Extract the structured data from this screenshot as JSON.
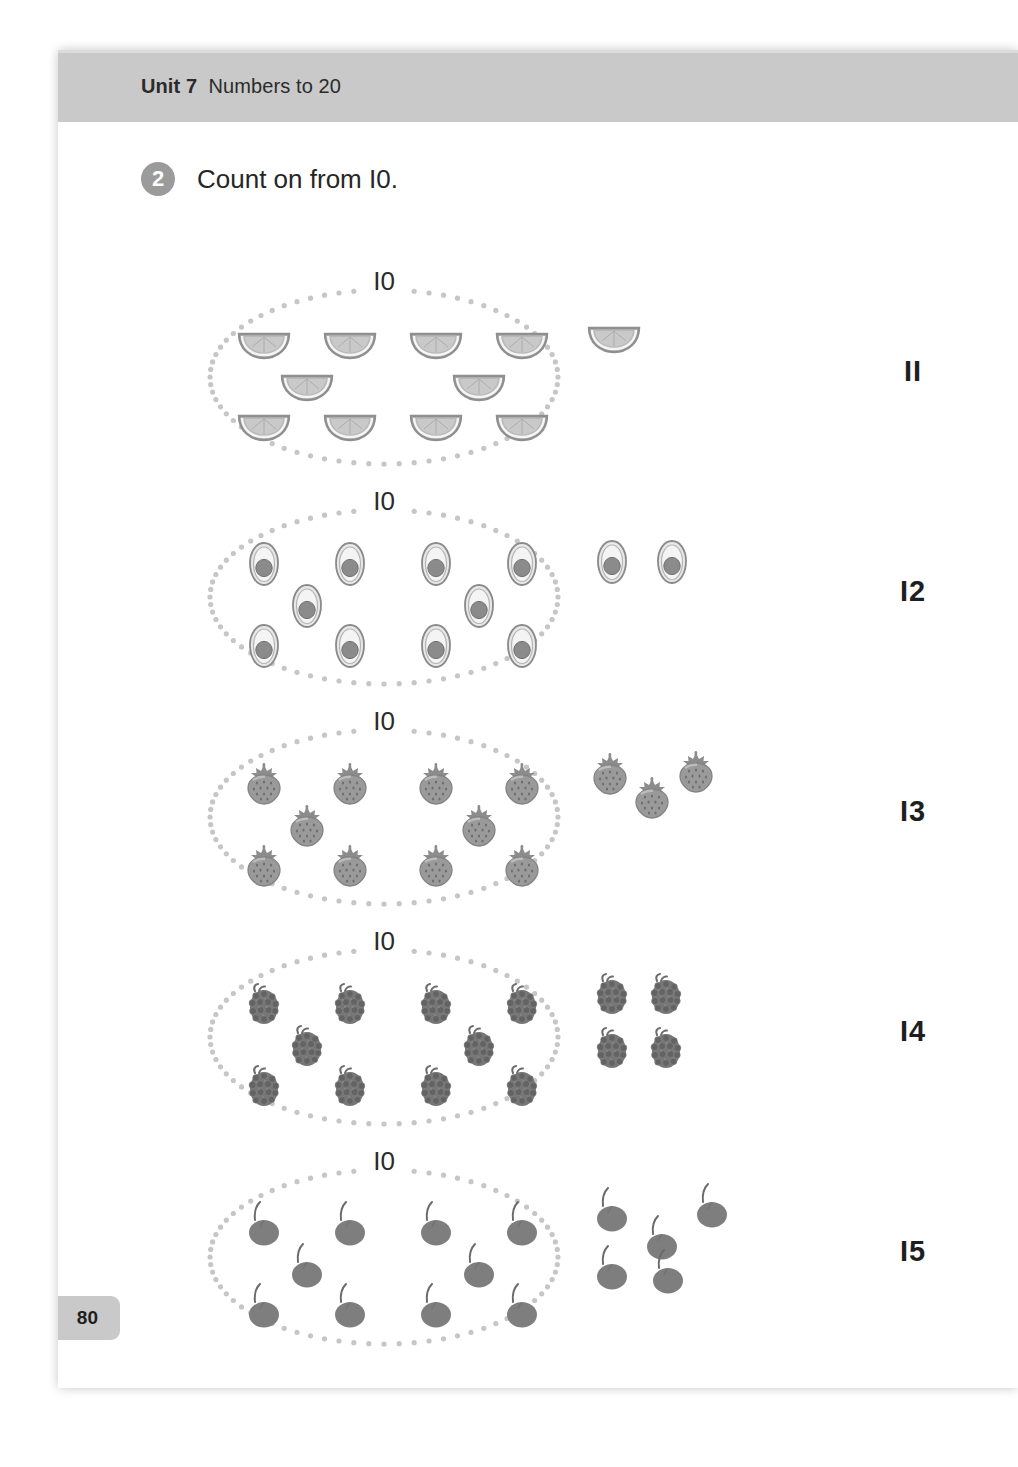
{
  "header": {
    "unit_label": "Unit 7",
    "unit_title": "Numbers to 20",
    "band_color": "#c9c9c9"
  },
  "task": {
    "number": "2",
    "prompt": "Count on from I0.",
    "badge_color": "#9b9b9b"
  },
  "page_number": "80",
  "colors": {
    "ink": "#2b2b2b",
    "dotted_ring": "#c6c6c6",
    "citrus_fill": "#b9b9b9",
    "citrus_rind": "#8f8f8f",
    "avocado_flesh": "#e8e8e8",
    "avocado_pit": "#8b8b8b",
    "strawberry": "#9a9a9a",
    "blackberry": "#767676",
    "cherry": "#7e7e7e"
  },
  "rows": [
    {
      "id": "row-oranges",
      "group_label": "I0",
      "group_count": 10,
      "loose_count": 1,
      "answer": "II",
      "fruit": "orange-wedge-icon",
      "fruit_name": "orange wedge"
    },
    {
      "id": "row-avocados",
      "group_label": "I0",
      "group_count": 10,
      "loose_count": 2,
      "answer": "I2",
      "fruit": "avocado-half-icon",
      "fruit_name": "avocado half"
    },
    {
      "id": "row-strawberries",
      "group_label": "I0",
      "group_count": 10,
      "loose_count": 3,
      "answer": "I3",
      "fruit": "strawberry-icon",
      "fruit_name": "strawberry"
    },
    {
      "id": "row-blackberries",
      "group_label": "I0",
      "group_count": 10,
      "loose_count": 4,
      "answer": "I4",
      "fruit": "blackberry-icon",
      "fruit_name": "blackberry"
    },
    {
      "id": "row-cherries",
      "group_label": "I0",
      "group_count": 10,
      "loose_count": 5,
      "answer": "I5",
      "fruit": "cherry-icon",
      "fruit_name": "cherry"
    }
  ],
  "layout": {
    "row_tops": [
      228,
      448,
      668,
      888,
      1108
    ],
    "group_positions": [
      [
        14,
        48
      ],
      [
        100,
        48
      ],
      [
        186,
        48
      ],
      [
        272,
        48
      ],
      [
        57,
        90
      ],
      [
        229,
        90
      ],
      [
        14,
        130
      ],
      [
        100,
        130
      ],
      [
        186,
        130
      ],
      [
        272,
        130
      ]
    ],
    "loose_positions": {
      "1": [
        [
          10,
          42
        ]
      ],
      "2": [
        [
          8,
          46
        ],
        [
          68,
          46
        ]
      ],
      "3": [
        [
          6,
          38
        ],
        [
          48,
          62
        ],
        [
          92,
          36
        ]
      ],
      "4": [
        [
          8,
          38
        ],
        [
          62,
          38
        ],
        [
          8,
          92
        ],
        [
          62,
          92
        ]
      ],
      "5": [
        [
          8,
          34
        ],
        [
          58,
          62
        ],
        [
          108,
          30
        ],
        [
          8,
          92
        ],
        [
          64,
          96
        ]
      ]
    }
  }
}
